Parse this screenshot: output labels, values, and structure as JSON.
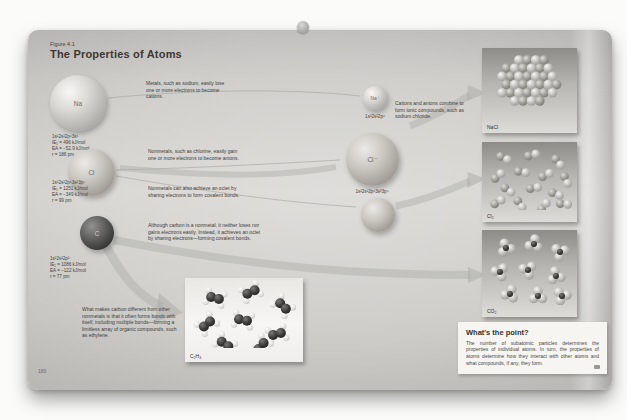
{
  "figure": {
    "number": "Figure 4.1",
    "title": "The Properties of Atoms"
  },
  "atoms": [
    {
      "symbol": "Na",
      "config": "1s²2s²2p⁶3s¹",
      "ionization_energy": "IE₁ = 496 kJ/mol",
      "electron_affinity": "EA = −52.9 kJ/mol",
      "radius": "r = 186 pm"
    },
    {
      "symbol": "Cl",
      "config": "1s²2s²2p⁶3s²3p⁵",
      "ionization_energy": "IE₁ = 1251 kJ/mol",
      "electron_affinity": "EA = −349 kJ/mol",
      "radius": "r = 99 pm"
    },
    {
      "symbol": "C",
      "config": "1s²2s²2p²",
      "ionization_energy": "IE₁ = 1086 kJ/mol",
      "electron_affinity": "EA = −122 kJ/mol",
      "radius": "r = 77 pm"
    }
  ],
  "ions": [
    {
      "symbol": "Na⁺",
      "config": "1s²2s²2p⁶"
    },
    {
      "symbol": "Cl⁻",
      "config": "1s²2s²2p⁶3s²3p⁶"
    }
  ],
  "annotations": {
    "metals": "Metals, such as sodium, easily lose one or more electrons to become cations.",
    "cations": "Cations and anions combine to form ionic compounds, such as sodium chloride.",
    "nonmetals_gain": "Nonmetals, such as chlorine, easily gain one or more electrons to become anions.",
    "nonmetals_share": "Nonmetals can also achieve an octet by sharing electrons to form covalent bonds.",
    "carbon": "Although carbon is a nonmetal, it neither loses nor gains electrons easily. Instead, it achieves an octet by sharing electrons—forming covalent bonds.",
    "carbon_self": "What makes carbon different from other nonmetals is that it often forms bonds with itself, including multiple bonds—forming a limitless array of organic compounds, such as ethylene."
  },
  "products": [
    {
      "label": "NaCl"
    },
    {
      "label": "Cl₂"
    },
    {
      "label": "CO₂"
    },
    {
      "label": "C₂H₄"
    }
  ],
  "whats_the_point": {
    "title": "What's the point?",
    "body": "The number of subatomic particles determines the properties of individual atoms. In turn, the properties of atoms determine how they interact with other atoms and what compounds, if any, they form."
  },
  "page_numbers": {
    "left": "180",
    "right": "181"
  }
}
